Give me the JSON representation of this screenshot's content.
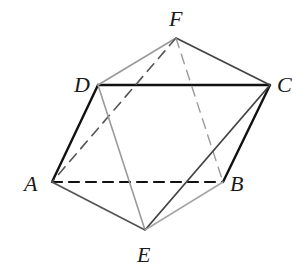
{
  "diagram": {
    "type": "octahedron-like polyhedron",
    "vertices": {
      "A": {
        "label": "A",
        "x": 52,
        "y": 182
      },
      "B": {
        "label": "B",
        "x": 223,
        "y": 182
      },
      "C": {
        "label": "C",
        "x": 270,
        "y": 85
      },
      "D": {
        "label": "D",
        "x": 98,
        "y": 85
      },
      "E": {
        "label": "E",
        "x": 145,
        "y": 230
      },
      "F": {
        "label": "F",
        "x": 176,
        "y": 38
      }
    },
    "edges": [
      {
        "from": "D",
        "to": "C",
        "style": "solid",
        "color": "#111111",
        "width": 2.4
      },
      {
        "from": "D",
        "to": "A",
        "style": "solid",
        "color": "#111111",
        "width": 2.4
      },
      {
        "from": "C",
        "to": "B",
        "style": "solid",
        "color": "#111111",
        "width": 2.4
      },
      {
        "from": "A",
        "to": "B",
        "style": "dashed",
        "color": "#111111",
        "width": 2.2
      },
      {
        "from": "F",
        "to": "D",
        "style": "solid",
        "color": "#9a9a9a",
        "width": 1.6
      },
      {
        "from": "F",
        "to": "C",
        "style": "solid",
        "color": "#444444",
        "width": 1.8
      },
      {
        "from": "F",
        "to": "A",
        "style": "dashed",
        "color": "#555555",
        "width": 1.6
      },
      {
        "from": "F",
        "to": "B",
        "style": "dashed",
        "color": "#9a9a9a",
        "width": 1.4
      },
      {
        "from": "D",
        "to": "E",
        "style": "solid",
        "color": "#9a9a9a",
        "width": 1.6
      },
      {
        "from": "C",
        "to": "E",
        "style": "solid",
        "color": "#444444",
        "width": 1.8
      },
      {
        "from": "A",
        "to": "E",
        "style": "solid",
        "color": "#555555",
        "width": 1.8
      },
      {
        "from": "B",
        "to": "E",
        "style": "solid",
        "color": "#a5a5a5",
        "width": 1.5
      }
    ]
  },
  "labels": {
    "A": "A",
    "B": "B",
    "C": "C",
    "D": "D",
    "E": "E",
    "F": "F"
  }
}
